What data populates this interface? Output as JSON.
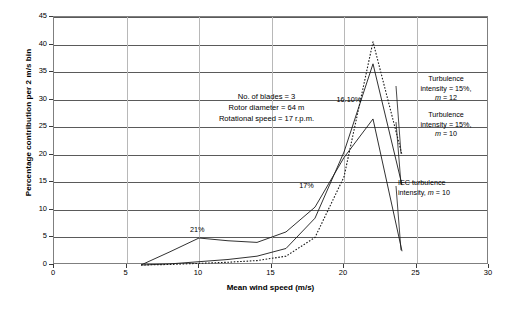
{
  "chart_data": {
    "type": "line",
    "title": "",
    "xlabel": "Mean wind speed (m/s)",
    "ylabel": "Percentage contribution per 2 m/s bin",
    "xlim": [
      0,
      30
    ],
    "ylim": [
      0,
      45
    ],
    "xticks": [
      0,
      5,
      10,
      15,
      20,
      25,
      30
    ],
    "yticks": [
      0,
      5,
      10,
      15,
      20,
      25,
      30,
      35,
      40,
      45
    ],
    "grid": "horizontal-major-and-vertical-major",
    "legend": "annotations-with-leader-lines",
    "series": [
      {
        "name": "Turbulence intensity = 15%, m = 12",
        "style": "dotted",
        "x": [
          6,
          8,
          10,
          12,
          14,
          16,
          18,
          20,
          22,
          24
        ],
        "y": [
          0.0,
          0.1,
          0.3,
          0.5,
          0.8,
          1.6,
          5.0,
          16.0,
          40.5,
          20.0
        ]
      },
      {
        "name": "Turbulence intensity = 15%, m = 10",
        "style": "solid",
        "x": [
          6,
          8,
          10,
          12,
          14,
          16,
          18,
          20,
          22,
          24
        ],
        "y": [
          0.0,
          0.2,
          0.6,
          1.0,
          1.6,
          3.0,
          8.5,
          20.5,
          36.5,
          14.5
        ]
      },
      {
        "name": "IEC turbulence intensity, m = 10",
        "style": "solid",
        "x": [
          6,
          8,
          10,
          12,
          14,
          16,
          18,
          20,
          22,
          24
        ],
        "y": [
          0.0,
          2.4,
          4.9,
          4.4,
          4.1,
          6.0,
          10.5,
          19.5,
          26.5,
          2.5
        ]
      }
    ],
    "point_labels": [
      {
        "text": "21%",
        "x": 10,
        "y": 4.9
      },
      {
        "text": "17%",
        "x": 17.6,
        "y": 13.0
      },
      {
        "text": "16.10%",
        "x": 21.0,
        "y": 28.5
      }
    ]
  },
  "axes": {
    "ylabel": "Percentage contribution per 2 m/s bin",
    "xlabel": "Mean wind speed (m/s)",
    "ytick_labels": [
      "0",
      "5",
      "10",
      "15",
      "20",
      "25",
      "30",
      "35",
      "40",
      "45"
    ],
    "xtick_labels": [
      "0",
      "5",
      "10",
      "15",
      "20",
      "25",
      "30"
    ]
  },
  "parameters_box": {
    "text": "No. of blades = 3\nRotor diameter = 64 m\nRotational speed  = 17 r.p.m."
  },
  "annotations": {
    "turb_m12": {
      "line1": "Turbulence",
      "line2": "intensity = 15%,",
      "line3_prefix": "m",
      "line3_suffix": " = 12"
    },
    "turb_m10": {
      "line1": "Turbulence",
      "line2": "intensity = 15%,",
      "line3_prefix": "m",
      "line3_suffix": " = 10"
    },
    "iec": {
      "line1": "IEC turbulence",
      "line2_prefix": "intensity, ",
      "line2_em": "m",
      "line2_suffix": " = 10"
    }
  },
  "point_labels": {
    "p21": "21%",
    "p17": "17%",
    "p1610": "16.10%"
  },
  "colors": {
    "line": "#1a1a1a",
    "grid": "#5a5a5a",
    "vgrid": "#b8b8b8",
    "frame": "#7f7f7f",
    "background": "#ffffff"
  }
}
